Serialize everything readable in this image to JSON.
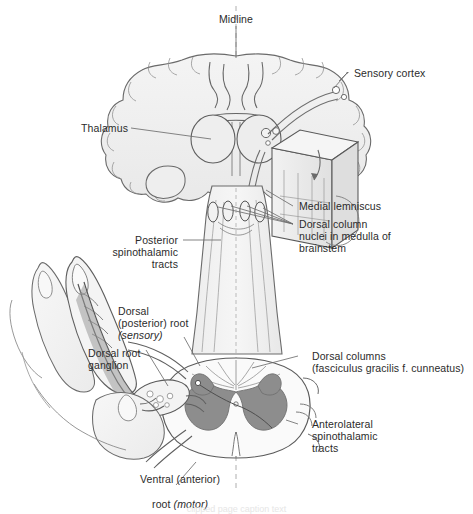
{
  "figure": {
    "colors": {
      "outline": "#5a5a5a",
      "fill_light": "#f0f0f0",
      "fill_mid": "#e2e2e2",
      "gray_matter": "#8d8d8d",
      "leader_line": "#6e6e6e",
      "text": "#2b2b2b",
      "background": "#ffffff"
    },
    "labels": {
      "midline": "Midline",
      "sensory_cortex": "Sensory cortex",
      "thalamus": "Thalamus",
      "medial_lemniscus": "Medial lemniscus",
      "dorsal_column_nuclei_line1": "Dorsal column",
      "dorsal_column_nuclei_line2": "nuclei in medulla of",
      "dorsal_column_nuclei_line3": "brainstem",
      "posterior_spinothalamic_line1": "Posterior",
      "posterior_spinothalamic_line2": "spinothalamic",
      "posterior_spinothalamic_line3": "tracts",
      "dorsal_root_line1": "Dorsal",
      "dorsal_root_line2": "(posterior) root",
      "dorsal_root_line3_italic": "(sensory)",
      "dorsal_root_ganglion_line1": "Dorsal root",
      "dorsal_root_ganglion_line2": "ganglion",
      "dorsal_columns_line1": "Dorsal columns",
      "dorsal_columns_line2": "(fasciculus gracilis f. cunneatus)",
      "anterolateral_line1": "Anterolateral",
      "anterolateral_line2": "spinothalamic",
      "anterolateral_line3": "tracts",
      "ventral_root_line1": "Ventral (anterior)",
      "ventral_root_line2_pre": "root ",
      "ventral_root_line2_italic": "(motor)"
    },
    "bottom_caption": "clipped page caption text"
  }
}
